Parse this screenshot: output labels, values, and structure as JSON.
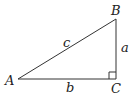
{
  "diagram": {
    "type": "right-triangle",
    "vertices": {
      "A": {
        "label": "A"
      },
      "B": {
        "label": "B"
      },
      "C": {
        "label": "C"
      }
    },
    "sides": {
      "a": {
        "label": "a",
        "between": [
          "B",
          "C"
        ]
      },
      "b": {
        "label": "b",
        "between": [
          "A",
          "C"
        ]
      },
      "c": {
        "label": "c",
        "between": [
          "A",
          "B"
        ]
      }
    },
    "right_angle_at": "C",
    "line_color": "#333333"
  }
}
